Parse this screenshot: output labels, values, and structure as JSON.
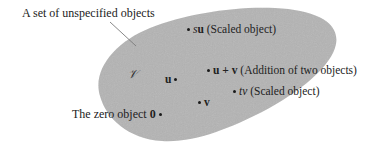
{
  "diagram": {
    "title_label": "A set of unspecified objects",
    "set_symbol": "𝒱",
    "colors": {
      "set_fill": "#b4b4b4",
      "background": "#ffffff",
      "text": "#222222",
      "arrow": "#777777"
    },
    "points": [
      {
        "id": "su",
        "scalar": "s",
        "vector": "u",
        "description": "(Scaled object)"
      },
      {
        "id": "u_plus_v",
        "expression": "u + v",
        "description": "(Addition of two objects)"
      },
      {
        "id": "tv",
        "scalar": "t",
        "vector": "v",
        "description": "(Scaled object)"
      },
      {
        "id": "u",
        "vector": "u"
      },
      {
        "id": "v",
        "vector": "v"
      },
      {
        "id": "zero",
        "label": "The zero object",
        "vector": "0"
      }
    ]
  }
}
